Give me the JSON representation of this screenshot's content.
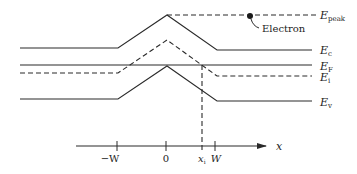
{
  "diagram": {
    "title": "",
    "bands": [
      {
        "id": "Ec",
        "main": "E",
        "sub": "c",
        "style": "solid"
      },
      {
        "id": "EF",
        "main": "E",
        "sub": "F",
        "style": "solid"
      },
      {
        "id": "Ei",
        "main": "E",
        "sub": "i",
        "style": "dashed"
      },
      {
        "id": "Ev",
        "main": "E",
        "sub": "v",
        "style": "solid"
      }
    ],
    "peak_level": {
      "main": "E",
      "sub": "peak",
      "style": "dashed"
    },
    "electron_label": "Electron",
    "axis": {
      "label": "x",
      "ticks": [
        {
          "label": "−W"
        },
        {
          "label": "0"
        },
        {
          "main": "x",
          "sub": "i"
        },
        {
          "label": "W"
        }
      ]
    }
  }
}
